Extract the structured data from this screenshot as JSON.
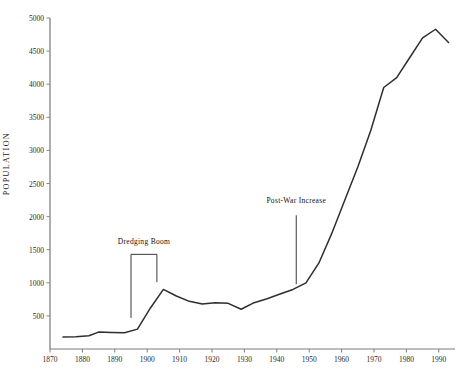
{
  "chart_data": {
    "type": "line",
    "title": "",
    "xlabel": "",
    "ylabel": "POPULATION",
    "xlim": [
      1870,
      1995
    ],
    "ylim": [
      0,
      5000
    ],
    "grid": false,
    "legend": null,
    "x_ticks": [
      "1870",
      "1880",
      "1890",
      "1900",
      "1910",
      "1920",
      "1930",
      "1940",
      "1950",
      "1960",
      "1970",
      "1980",
      "1990"
    ],
    "y_ticks": [
      "500",
      "1000",
      "1500",
      "2000",
      "2500",
      "3000",
      "3500",
      "4000",
      "4500",
      "5000"
    ],
    "series": [
      {
        "name": "Population",
        "x": [
          1874,
          1878,
          1882,
          1885,
          1889,
          1893,
          1897,
          1901,
          1905,
          1909,
          1913,
          1917,
          1921,
          1925,
          1929,
          1933,
          1937,
          1941,
          1945,
          1949,
          1953,
          1957,
          1961,
          1965,
          1969,
          1973,
          1977,
          1981,
          1985,
          1989,
          1993
        ],
        "values": [
          180,
          185,
          200,
          255,
          250,
          245,
          300,
          620,
          900,
          800,
          720,
          680,
          700,
          690,
          600,
          700,
          760,
          830,
          900,
          1000,
          1300,
          1750,
          2250,
          2750,
          3300,
          3950,
          4100,
          4400,
          4700,
          4830,
          4630
        ]
      }
    ],
    "annotations": [
      {
        "label": "Dredging Boom",
        "kind": "bracket",
        "x_start": 1895,
        "x_end": 1903,
        "label_year": 1899,
        "label_value": 1620,
        "bracket_top_value": 1430,
        "left_leg_bottom_value": 470,
        "right_leg_bottom_value": 1010
      },
      {
        "label": "Post-War Increase",
        "kind": "pointer",
        "x": 1946,
        "label_year": 1946,
        "label_value": 2230,
        "line_top_value": 2020,
        "line_bottom_value": 980
      }
    ]
  },
  "axis": {
    "ylabel": "POPULATION"
  }
}
